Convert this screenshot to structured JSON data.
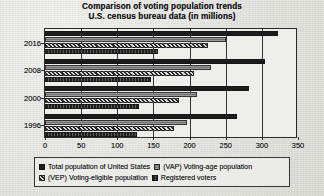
{
  "title": {
    "line1": "Comparison of voting population trends",
    "line2": "U.S. census bureau data (in millions)"
  },
  "chart_data": {
    "type": "bar",
    "orientation": "horizontal",
    "title": "Comparison of voting population trends U.S. census bureau data (in millions)",
    "xlabel": "",
    "ylabel": "",
    "xlim": [
      0,
      350
    ],
    "xticks": [
      0,
      50,
      100,
      150,
      200,
      250,
      300,
      350
    ],
    "categories": [
      "2016",
      "2008",
      "2000",
      "1996"
    ],
    "grid": true,
    "legend_position": "bottom",
    "series": [
      {
        "name": "Total population of United States",
        "key": "total_population",
        "pattern": "solid-dark",
        "values": [
          323,
          304,
          282,
          265
        ]
      },
      {
        "name": "(VAP) Voting-age population",
        "key": "voting_age_population",
        "pattern": "horizontal-lines-gray",
        "values": [
          250,
          230,
          210,
          196
        ]
      },
      {
        "name": "(VEP) Voting-eligible population",
        "key": "voting_eligible_population",
        "pattern": "checkered",
        "values": [
          225,
          206,
          186,
          179
        ]
      },
      {
        "name": "Registered voters",
        "key": "registered_voters",
        "pattern": "vertical-lines-dark",
        "values": [
          157,
          146,
          130,
          127
        ]
      }
    ]
  },
  "legend": {
    "rows": [
      [
        {
          "label": "Total population of United States",
          "series": 0
        },
        {
          "label": "(VAP) Voting-age population",
          "series": 1
        }
      ],
      [
        {
          "label": "(VEP) Voting-eligible population",
          "series": 2
        },
        {
          "label": "Registered voters",
          "series": 3
        }
      ]
    ]
  },
  "colors": {
    "frame": "#2b2b2b",
    "text": "#16161a",
    "background": "#e9e9e6",
    "plot_background": "#eeeeea",
    "series": [
      "#1d1d1d",
      "#7f7f7f",
      "#404040",
      "#2a2a2a"
    ]
  }
}
